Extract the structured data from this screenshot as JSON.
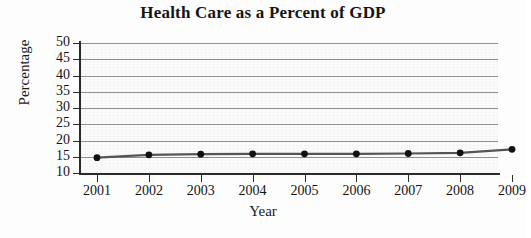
{
  "chart_data": {
    "type": "line",
    "title": "Health Care as a Percent of GDP",
    "xlabel": "Year",
    "ylabel": "Percentage",
    "categories": [
      "2001",
      "2002",
      "2003",
      "2004",
      "2005",
      "2006",
      "2007",
      "2008",
      "2009"
    ],
    "x": [
      2001,
      2002,
      2003,
      2004,
      2005,
      2006,
      2007,
      2008,
      2009
    ],
    "values": [
      14.7,
      15.6,
      15.8,
      15.9,
      15.9,
      15.9,
      16.0,
      16.2,
      17.3
    ],
    "series": [
      {
        "name": "Health Care as a Percent of GDP",
        "values": [
          14.7,
          15.6,
          15.8,
          15.9,
          15.9,
          15.9,
          16.0,
          16.2,
          17.3
        ]
      }
    ],
    "ylim": [
      10,
      50
    ],
    "yticks": [
      10,
      15,
      20,
      25,
      30,
      35,
      40,
      45,
      50
    ],
    "ytick_labels": [
      "10",
      "15",
      "20",
      "25",
      "30",
      "35",
      "40",
      "45",
      "50"
    ],
    "xlim": [
      2001,
      2009
    ],
    "grid": "horizontal",
    "legend": "none",
    "marker": "filled-circle",
    "line_color": "#555555",
    "marker_color": "#111111",
    "grid_color": "#7e7e7e",
    "plot_background": "#fbfbfb"
  }
}
